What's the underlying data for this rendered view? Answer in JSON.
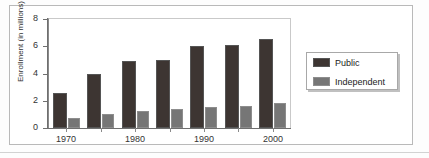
{
  "chart_data": {
    "type": "bar",
    "title": "",
    "xlabel": "",
    "ylabel": "Enrollment (in millions)",
    "ylim": [
      0,
      8
    ],
    "yticks": [
      0,
      2,
      4,
      6,
      8
    ],
    "ytick_labels": [
      "0",
      "2",
      "4",
      "6",
      "8"
    ],
    "grid": false,
    "legend_position": "right",
    "categories": [
      "1970",
      "1975",
      "1980",
      "1985",
      "1990",
      "1995",
      "2000"
    ],
    "xtick_labels": [
      "1970",
      "1980",
      "1990",
      "2000"
    ],
    "xtick_categories": [
      "1970",
      "1980",
      "1990",
      "2000"
    ],
    "series": [
      {
        "name": "Public",
        "color": "#3d3532",
        "values": [
          2.6,
          4.0,
          4.9,
          5.0,
          6.0,
          6.1,
          6.55
        ]
      },
      {
        "name": "Independent",
        "color": "#767676",
        "values": [
          0.75,
          1.0,
          1.25,
          1.4,
          1.55,
          1.6,
          1.85
        ]
      }
    ]
  },
  "legend": {
    "entries": [
      {
        "label": "Public",
        "swatch": "public"
      },
      {
        "label": "Independent",
        "swatch": "independent"
      }
    ]
  }
}
